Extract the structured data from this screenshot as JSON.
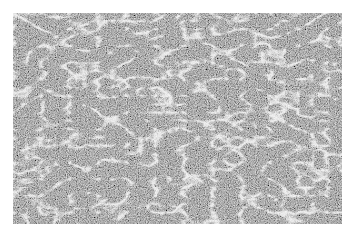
{
  "image": {
    "subject": "histology micrograph, grayscale tissue section",
    "description": "Dense cellular tissue with interlacing pale channels/spaces forming a trabecular/reticular pattern",
    "colors": {
      "background": "#ffffff",
      "tissue_dark": "#5a5a5a",
      "tissue_mid": "#8f8f8f",
      "channel_light": "#e8e8e8"
    }
  }
}
